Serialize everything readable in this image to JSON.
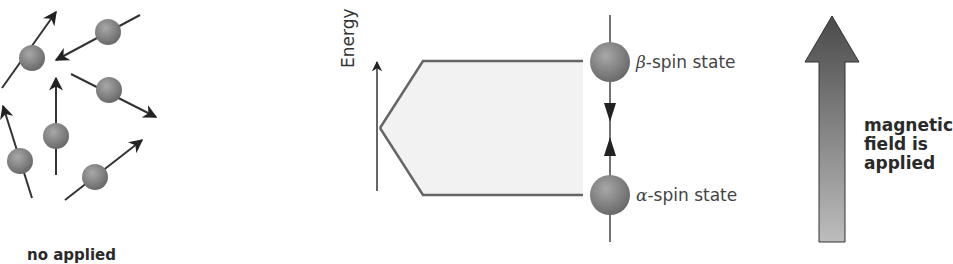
{
  "left_panel": {
    "caption": "no applied",
    "spins": [
      {
        "cx": 32,
        "cy": 58,
        "angle": -50
      },
      {
        "cx": 108,
        "cy": 32,
        "angle": -150
      },
      {
        "cx": 109,
        "cy": 90,
        "angle": 30
      },
      {
        "cx": 56,
        "cy": 136,
        "angle": -90
      },
      {
        "cx": 20,
        "cy": 161,
        "angle": -105
      },
      {
        "cx": 95,
        "cy": 177,
        "angle": -30
      }
    ]
  },
  "energy_diagram": {
    "axis_label": "Energy",
    "upper_state": {
      "symbol": "β",
      "label": "-spin state"
    },
    "lower_state": {
      "symbol": "α",
      "label": "-spin state"
    }
  },
  "field_arrow": {
    "label_lines": [
      "magnetic",
      "field is",
      "applied"
    ]
  },
  "colors": {
    "sphere": "#7a7a7a",
    "line": "#555555",
    "fill": "#f2f2f2",
    "arrow_top": "#4a4a4a",
    "arrow_bottom": "#b8b8b8"
  }
}
